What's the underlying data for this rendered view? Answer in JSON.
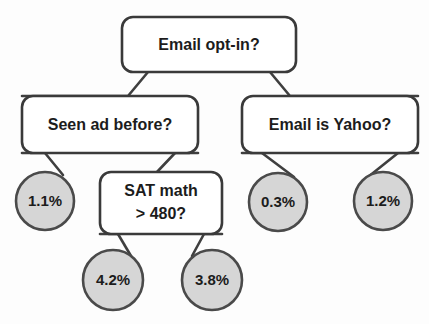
{
  "diagram": {
    "type": "decision-tree",
    "colors": {
      "background": "#fdfdfd",
      "box_fill": "#ffffff",
      "box_stroke": "#3a3a3a",
      "leaf_fill": "#d6d6d6",
      "leaf_stroke": "#4a4a4a",
      "edge_stroke": "#3f3f3f",
      "text": "#1c1c1c"
    }
  },
  "nodes": {
    "root": {
      "id": "email-opt-in",
      "label": "Email opt-in?",
      "kind": "decision",
      "x": 122,
      "y": 17,
      "w": 174,
      "h": 55
    },
    "left_child": {
      "id": "seen-ad-before",
      "label": "Seen ad before?",
      "kind": "decision",
      "x": 22,
      "y": 96,
      "w": 176,
      "h": 57
    },
    "right_child": {
      "id": "email-is-yahoo",
      "label": "Email is Yahoo?",
      "kind": "decision",
      "x": 242,
      "y": 96,
      "w": 176,
      "h": 57
    },
    "sat_math": {
      "id": "sat-math-480",
      "label_line1": "SAT math",
      "label_line2": "> 480?",
      "kind": "decision",
      "x": 100,
      "y": 172,
      "w": 122,
      "h": 62
    }
  },
  "leaves": [
    {
      "id": "leaf-1-1",
      "label": "1.1%",
      "value": 1.1,
      "cx": 45,
      "cy": 201,
      "r": 29
    },
    {
      "id": "leaf-0-3",
      "label": "0.3%",
      "value": 0.3,
      "cx": 278,
      "cy": 202,
      "r": 29
    },
    {
      "id": "leaf-1-2",
      "label": "1.2%",
      "value": 1.2,
      "cx": 383,
      "cy": 201,
      "r": 29
    },
    {
      "id": "leaf-4-2",
      "label": "4.2%",
      "value": 4.2,
      "cx": 113,
      "cy": 280,
      "r": 30
    },
    {
      "id": "leaf-3-8",
      "label": "3.8%",
      "value": 3.8,
      "cx": 212,
      "cy": 280,
      "r": 30
    }
  ],
  "edges": [
    {
      "id": "edge-root-to-seen-ad",
      "from": "email-opt-in",
      "to": "seen-ad-before"
    },
    {
      "id": "edge-root-to-yahoo",
      "from": "email-opt-in",
      "to": "email-is-yahoo"
    },
    {
      "id": "edge-seen-ad-to-1-1",
      "from": "seen-ad-before",
      "to": "leaf-1-1"
    },
    {
      "id": "edge-seen-ad-to-sat",
      "from": "seen-ad-before",
      "to": "sat-math-480"
    },
    {
      "id": "edge-sat-to-4-2",
      "from": "sat-math-480",
      "to": "leaf-4-2"
    },
    {
      "id": "edge-sat-to-3-8",
      "from": "sat-math-480",
      "to": "leaf-3-8"
    },
    {
      "id": "edge-yahoo-to-0-3",
      "from": "email-is-yahoo",
      "to": "leaf-0-3"
    },
    {
      "id": "edge-yahoo-to-1-2",
      "from": "email-is-yahoo",
      "to": "leaf-1-2"
    }
  ]
}
